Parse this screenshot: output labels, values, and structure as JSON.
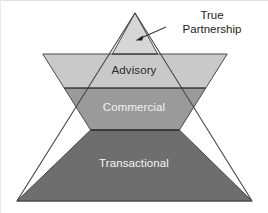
{
  "figure": {
    "type": "pyramid-diagram",
    "width": 268,
    "height": 213,
    "background_color": "#ffffff",
    "border_color": "#e2e2e2"
  },
  "pyramid": {
    "apex": {
      "x": 135,
      "y": 13
    },
    "base_left": {
      "x": 17,
      "y": 201
    },
    "base_right": {
      "x": 252,
      "y": 201
    },
    "divider_color": "#3a3a3a",
    "outline_color": "#4a4a4a",
    "tiers": [
      {
        "id": "tier-1",
        "label": "",
        "rank": 4,
        "position": "top",
        "fill_color": "#d6d6d6",
        "text_color": "#2b2b2b",
        "top_y": 13,
        "bottom_y": 54,
        "callout_label": "True Partnership"
      },
      {
        "id": "tier-2",
        "label": "Advisory",
        "rank": 3,
        "position": "upper-middle",
        "fill_color": "#c9c9c9",
        "text_color": "#2b2b2b",
        "top_y": 54,
        "bottom_y": 88
      },
      {
        "id": "tier-3",
        "label": "Commercial",
        "rank": 2,
        "position": "lower-middle",
        "fill_color": "#9a9a9a",
        "text_color": "#f2f2f2",
        "top_y": 88,
        "bottom_y": 130
      },
      {
        "id": "tier-4",
        "label": "Transactional",
        "rank": 1,
        "position": "base",
        "fill_color": "#6e6e6e",
        "text_color": "#f4f4f4",
        "top_y": 130,
        "bottom_y": 201
      }
    ]
  },
  "callout": {
    "line_1": "True",
    "line_2": "Partnership",
    "leader_color": "#3a3a3a",
    "arrow_tip": {
      "x": 137,
      "y": 40
    },
    "leader_end": {
      "x": 166,
      "y": 27
    }
  }
}
